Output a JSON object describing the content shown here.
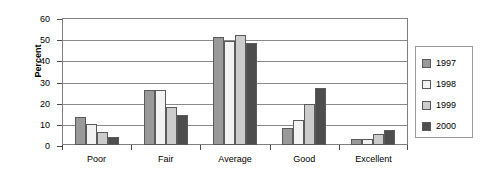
{
  "chart_data": {
    "type": "bar",
    "title": "",
    "xlabel": "",
    "ylabel": "Percent",
    "ylim": [
      0,
      60
    ],
    "yticks": [
      0,
      10,
      20,
      30,
      40,
      50,
      60
    ],
    "grid": true,
    "legend_position": "right",
    "categories": [
      "Poor",
      "Fair",
      "Average",
      "Good",
      "Excellent"
    ],
    "series": [
      {
        "name": "1997",
        "color": "#999999",
        "values": [
          13,
          26,
          51,
          8,
          3
        ]
      },
      {
        "name": "1998",
        "color": "#f2f2f2",
        "values": [
          10,
          26,
          49,
          12,
          3
        ]
      },
      {
        "name": "1999",
        "color": "#cccccc",
        "values": [
          6,
          18,
          52,
          19.5,
          5
        ]
      },
      {
        "name": "2000",
        "color": "#4d4d4d",
        "values": [
          4,
          14,
          48,
          27,
          7
        ]
      }
    ]
  },
  "legend": {
    "items": [
      {
        "label": "1997",
        "color": "#999999"
      },
      {
        "label": "1998",
        "color": "#f2f2f2"
      },
      {
        "label": "1999",
        "color": "#cccccc"
      },
      {
        "label": "2000",
        "color": "#4d4d4d"
      }
    ]
  },
  "axis": {
    "y_title": "Percent",
    "y_tick_labels": [
      "0",
      "10",
      "20",
      "30",
      "40",
      "50",
      "60"
    ],
    "x_tick_labels": [
      "Poor",
      "Fair",
      "Average",
      "Good",
      "Excellent"
    ]
  }
}
